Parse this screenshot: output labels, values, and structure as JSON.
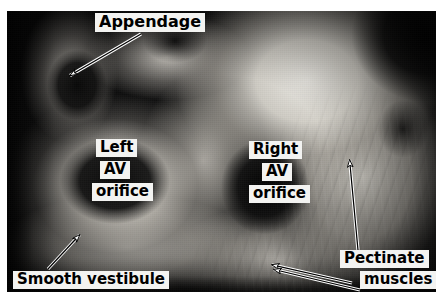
{
  "figure": {
    "kind": "anatomical-photograph",
    "palette": {
      "label_background": "#f3f3f1",
      "label_text": "#000000",
      "arrow_stroke": "#000000",
      "arrow_fill": "#ffffff",
      "plate_background": "#0b0b0b",
      "page_background": "#ffffff"
    }
  },
  "labels": {
    "appendage": "Appendage",
    "left_orifice_line1": "Left",
    "left_orifice_line2": "AV",
    "left_orifice_line3": "orifice",
    "right_orifice_line1": "Right",
    "right_orifice_line2": "AV",
    "right_orifice_line3": "orifice",
    "smooth_vestibule": "Smooth vestibule",
    "pectinate_line1": "Pectinate",
    "pectinate_line2": "muscles"
  },
  "arrows": [
    {
      "name": "appendage-arrow",
      "points_to": "appendage",
      "tail": [
        141,
        34
      ],
      "head": [
        66,
        78
      ]
    },
    {
      "name": "smooth-vestibule-arrow",
      "points_to": "smooth vestibule",
      "tail": [
        48,
        269
      ],
      "head": [
        83,
        232
      ]
    },
    {
      "name": "pectinate-muscles-arrow-vertical",
      "points_to": "pectinate muscles of right atrial wall",
      "tail": [
        358,
        250
      ],
      "head": [
        349,
        152
      ]
    },
    {
      "name": "pectinate-muscles-arrow-upper",
      "points_to": "pectinate muscles on atrial floor",
      "tail": [
        352,
        283
      ],
      "head": [
        264,
        263
      ]
    },
    {
      "name": "pectinate-muscles-arrow-lower",
      "points_to": "pectinate muscles on atrial floor",
      "tail": [
        358,
        289
      ],
      "head": [
        266,
        268
      ]
    }
  ]
}
